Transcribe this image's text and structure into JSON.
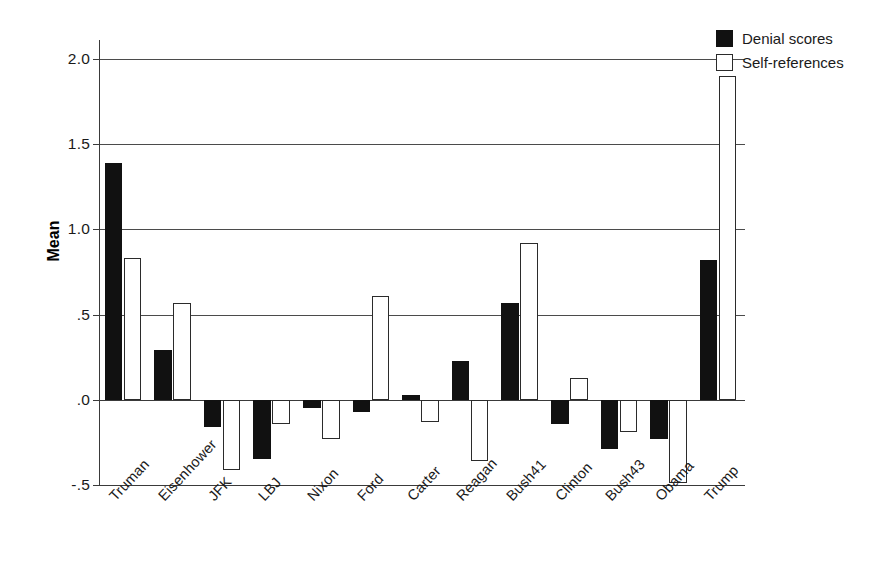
{
  "chart_data": {
    "type": "bar",
    "title": "",
    "xlabel": "",
    "ylabel": "Mean",
    "ylim": [
      -0.5,
      2.0
    ],
    "yticks": [
      2.0,
      1.5,
      1.0,
      0.5,
      0.0,
      -0.5
    ],
    "ytick_labels": [
      "2.0",
      "1.5",
      "1.0",
      ".5",
      ".0",
      "-.5"
    ],
    "grid": true,
    "legend_position": "top-right",
    "categories": [
      "Truman",
      "Eisenhower",
      "JFK",
      "LBJ",
      "Nixon",
      "Ford",
      "Carter",
      "Reagan",
      "Bush41",
      "Clinton",
      "Bush43",
      "Obama",
      "Trump"
    ],
    "series": [
      {
        "name": "Denial scores",
        "color": "#111111",
        "values": [
          1.39,
          0.29,
          -0.16,
          -0.35,
          -0.05,
          -0.07,
          0.03,
          0.23,
          0.57,
          -0.14,
          -0.29,
          -0.23,
          0.82
        ]
      },
      {
        "name": "Self-references",
        "color": "#ffffff",
        "values": [
          0.83,
          0.57,
          -0.41,
          -0.14,
          -0.23,
          0.61,
          -0.13,
          -0.36,
          0.92,
          0.13,
          -0.19,
          -0.49,
          1.9
        ]
      }
    ]
  },
  "legend": {
    "items": [
      {
        "label": "Denial scores",
        "swatch": "filled"
      },
      {
        "label": "Self-references",
        "swatch": "outlined"
      }
    ]
  },
  "axis": {
    "y_title": "Mean"
  }
}
